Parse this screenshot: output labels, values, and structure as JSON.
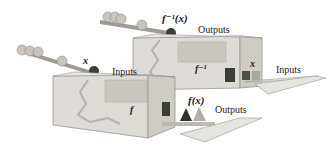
{
  "diagram": {
    "back_machine": {
      "name": "f^{-1}",
      "label": "f⁻¹",
      "output_label": "f⁻¹(x)",
      "outputs_text": "Outputs",
      "inputs_text": "Inputs",
      "input_symbol": "x"
    },
    "front_machine": {
      "name": "f",
      "label": "f",
      "input_symbol": "x",
      "inputs_text": "Inputs",
      "output_label": "f(x)",
      "outputs_text": "Outputs"
    },
    "colors": {
      "box_face": "#dedbd6",
      "box_edge": "#9a9690",
      "ball": "#b8b4ad",
      "dark_ball": "#3b3f3a",
      "tray": "#e6e4df"
    }
  }
}
